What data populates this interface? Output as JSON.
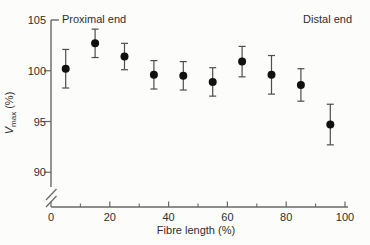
{
  "chart_data": {
    "type": "scatter",
    "title": "",
    "xlabel": "Fibre length (%)",
    "ylabel": "Vmax (%)",
    "ylabel_parts": {
      "base": "V",
      "sub": "max",
      "suffix": " (%)"
    },
    "annotations": [
      {
        "text": "Proximal end",
        "position": "top-left"
      },
      {
        "text": "Distal end",
        "position": "top-right"
      }
    ],
    "x": [
      5,
      15,
      25,
      35,
      45,
      55,
      65,
      75,
      85,
      95
    ],
    "y": [
      100.2,
      102.7,
      101.4,
      99.6,
      99.5,
      98.9,
      100.9,
      99.6,
      98.6,
      94.7
    ],
    "y_error": [
      1.9,
      1.4,
      1.3,
      1.4,
      1.4,
      1.4,
      1.5,
      1.9,
      1.6,
      2.0
    ],
    "x_ticks_major": [
      0,
      20,
      40,
      60,
      80,
      100
    ],
    "x_ticks_minor": [
      10,
      30,
      50,
      70,
      90
    ],
    "y_ticks": [
      90,
      95,
      100,
      105
    ],
    "xlim": [
      0,
      100
    ],
    "ylim_display": [
      90,
      105
    ],
    "axis_break": "y-axis broken below 90",
    "marker": "filled-circle",
    "grid": "off",
    "legend": "none",
    "colors": {
      "marker": "#101010",
      "errorbar": "#4d4d4d",
      "axis": "#686868",
      "text": "#2e2e2e",
      "background": "#fcfcfa"
    }
  }
}
